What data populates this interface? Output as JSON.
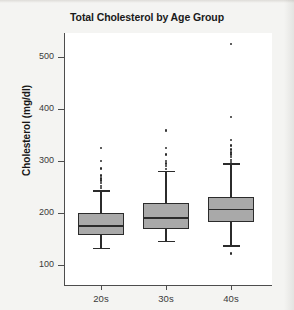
{
  "chart_data": {
    "type": "box",
    "title": "Total Cholesterol by Age Group",
    "xlabel": "",
    "ylabel": "Cholesterol (mg/dl)",
    "categories": [
      "20s",
      "30s",
      "40s"
    ],
    "ylim": [
      80,
      545
    ],
    "yticks": [
      100,
      200,
      300,
      400,
      500
    ],
    "ytick_labels": [
      "100",
      "200",
      "300",
      "400",
      "500"
    ],
    "grid": false,
    "legend": "none",
    "box_fill_color": "#a9a9a9",
    "line_color": "#2b2b2b",
    "panel_background": "#ffffff",
    "figure_background": "#f4f4f2",
    "boxes": [
      {
        "category": "20s",
        "whisker_low": 132,
        "q1": 158,
        "median": 175,
        "q3": 200,
        "whisker_high": 242,
        "outliers": [
          248,
          252,
          258,
          262,
          266,
          272,
          286,
          300,
          325
        ]
      },
      {
        "category": "30s",
        "whisker_low": 145,
        "q1": 170,
        "median": 190,
        "q3": 219,
        "whisker_high": 280,
        "outliers": [
          285,
          290,
          295,
          300,
          312,
          325,
          358,
          360
        ]
      },
      {
        "category": "40s",
        "whisker_low": 137,
        "q1": 182,
        "median": 207,
        "q3": 230,
        "whisker_high": 294,
        "outliers": [
          122,
          298,
          302,
          308,
          312,
          316,
          322,
          330,
          340,
          385,
          525
        ]
      }
    ]
  }
}
